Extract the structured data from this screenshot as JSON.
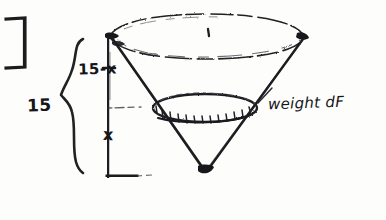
{
  "figure": {
    "kind": "hand-drawn-sketch",
    "background_color": "#fdfdfc",
    "ink_color": "#16161a"
  },
  "labels": {
    "height_above_disk": "15-x",
    "total_height": "15",
    "disk_height": "x",
    "force_label": "weight dF"
  },
  "geometry": {
    "axis": {
      "x": 108,
      "top_y": 36,
      "bottom_y": 178
    },
    "top_rim": {
      "center_x": 206,
      "center_y": 37,
      "radius_x": 98,
      "radius_y": 22
    },
    "inner_disk": {
      "center_x": 205,
      "center_y": 108,
      "radius_x": 52,
      "radius_y": 14
    },
    "apex": {
      "x": 205,
      "y": 172
    },
    "brace": {
      "x": 70,
      "top_y": 38,
      "bottom_y": 172
    },
    "left_bracket": {
      "x": 8,
      "top_y": 18,
      "bottom_y": 68,
      "width": 18
    },
    "ticks": [
      {
        "y": 108,
        "x_start": 108,
        "x_end": 140,
        "weight": "faint"
      },
      {
        "y": 176,
        "x_start": 108,
        "x_end": 146,
        "weight": "strong"
      }
    ]
  }
}
